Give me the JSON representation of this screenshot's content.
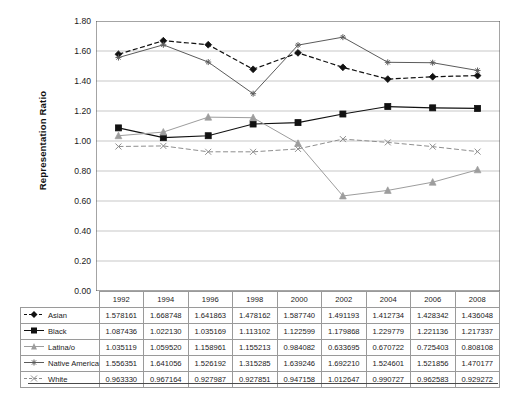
{
  "chart_data": {
    "type": "line",
    "title": "",
    "xlabel": "",
    "ylabel": "Representation Ratio",
    "categories": [
      "1992",
      "1994",
      "1996",
      "1998",
      "2000",
      "2002",
      "2004",
      "2006",
      "2008"
    ],
    "ylim": [
      0.0,
      1.8
    ],
    "ytick_step": 0.2,
    "yticks": [
      "1.80",
      "1.60",
      "1.40",
      "1.20",
      "1.00",
      "0.80",
      "0.60",
      "0.40",
      "0.20",
      "0.00"
    ],
    "grid": "horizontal",
    "legend_position": "table-row-labels",
    "series": [
      {
        "name": "Asian",
        "marker": "diamond",
        "line": "dashed",
        "color": "#111111",
        "values": [
          1.578161,
          1.668748,
          1.641863,
          1.478162,
          1.58774,
          1.491193,
          1.412734,
          1.428342,
          1.436048
        ],
        "labels": [
          "1.578161",
          "1.668748",
          "1.641863",
          "1.478162",
          "1.587740",
          "1.491193",
          "1.412734",
          "1.428342",
          "1.436048"
        ]
      },
      {
        "name": "Black",
        "marker": "square",
        "line": "solid",
        "color": "#111111",
        "values": [
          1.087436,
          1.02213,
          1.035169,
          1.113102,
          1.122599,
          1.179868,
          1.229779,
          1.221136,
          1.217337
        ],
        "labels": [
          "1.087436",
          "1.022130",
          "1.035169",
          "1.113102",
          "1.122599",
          "1.179868",
          "1.229779",
          "1.221136",
          "1.217337"
        ]
      },
      {
        "name": "Latina/o",
        "marker": "triangle",
        "line": "solid",
        "color": "#9d9d9d",
        "values": [
          1.035119,
          1.05952,
          1.158961,
          1.155213,
          0.984082,
          0.633695,
          0.670722,
          0.725403,
          0.808108
        ],
        "labels": [
          "1.035119",
          "1.059520",
          "1.158961",
          "1.155213",
          "0.984082",
          "0.633695",
          "0.670722",
          "0.725403",
          "0.808108"
        ]
      },
      {
        "name": "Native American",
        "marker": "asterisk",
        "line": "solid",
        "color": "#5b5b5b",
        "values": [
          1.556351,
          1.641056,
          1.526192,
          1.315285,
          1.639246,
          1.69221,
          1.524601,
          1.521856,
          1.470177
        ],
        "labels": [
          "1.556351",
          "1.641056",
          "1.526192",
          "1.315285",
          "1.639246",
          "1.692210",
          "1.524601",
          "1.521856",
          "1.470177"
        ]
      },
      {
        "name": "White",
        "marker": "cross",
        "line": "dashed",
        "color": "#8e8e8e",
        "values": [
          0.96333,
          0.967164,
          0.927987,
          0.927851,
          0.947158,
          1.012647,
          0.990727,
          0.962583,
          0.929272
        ],
        "labels": [
          "0.963330",
          "0.967164",
          "0.927987",
          "0.927851",
          "0.947158",
          "1.012647",
          "0.990727",
          "0.962583",
          "0.929272"
        ]
      }
    ]
  },
  "table": {
    "corner": "",
    "columns": [
      "1992",
      "1994",
      "1996",
      "1998",
      "2000",
      "2002",
      "2004",
      "2006",
      "2008"
    ],
    "rows": [
      {
        "label": "Asian",
        "values": [
          "1.578161",
          "1.668748",
          "1.641863",
          "1.478162",
          "1.587740",
          "1.491193",
          "1.412734",
          "1.428342",
          "1.436048"
        ]
      },
      {
        "label": "Black",
        "values": [
          "1.087436",
          "1.022130",
          "1.035169",
          "1.113102",
          "1.122599",
          "1.179868",
          "1.229779",
          "1.221136",
          "1.217337"
        ]
      },
      {
        "label": "Latina/o",
        "values": [
          "1.035119",
          "1.059520",
          "1.158961",
          "1.155213",
          "0.984082",
          "0.633695",
          "0.670722",
          "0.725403",
          "0.808108"
        ]
      },
      {
        "label": "Native American",
        "values": [
          "1.556351",
          "1.641056",
          "1.526192",
          "1.315285",
          "1.639246",
          "1.692210",
          "1.524601",
          "1.521856",
          "1.470177"
        ]
      },
      {
        "label": "White",
        "values": [
          "0.963330",
          "0.967164",
          "0.927987",
          "0.927851",
          "0.947158",
          "1.012647",
          "0.990727",
          "0.962583",
          "0.929272"
        ]
      }
    ]
  },
  "colors": {
    "axis": "#4a4a4a",
    "grid": "#b9b9b9",
    "table_border": "#9a9a9a",
    "text": "#1a1a1a"
  }
}
